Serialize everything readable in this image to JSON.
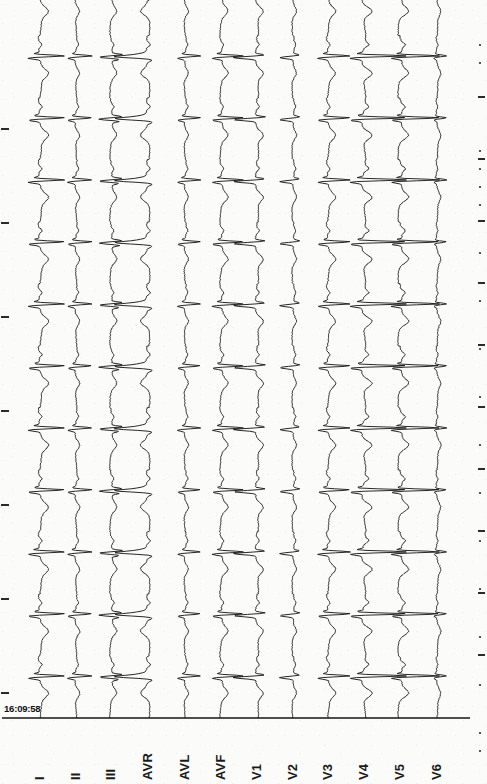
{
  "document": {
    "kind": "12-lead electrocardiogram strip",
    "orientation": "rotated-90-traces-run-vertically",
    "timestamp": "16:09:58",
    "background_color": "#fbfbf9",
    "trace_color": "#1c1c1c"
  },
  "leads": [
    {
      "label": "I",
      "x": 40,
      "amplitude": 26,
      "morphology": "qRs-tall-R"
    },
    {
      "label": "II",
      "x": 76,
      "amplitude": 17,
      "morphology": "rS-notched"
    },
    {
      "label": "III",
      "x": 111,
      "amplitude": 19,
      "morphology": "rSr-biphasic"
    },
    {
      "label": "AVR",
      "x": 148,
      "amplitude": 30,
      "morphology": "wide-negative"
    },
    {
      "label": "AVL",
      "x": 185,
      "amplitude": 16,
      "morphology": "small-rS"
    },
    {
      "label": "AVF",
      "x": 221,
      "amplitude": 22,
      "morphology": "rS-broad"
    },
    {
      "label": "V1",
      "x": 257,
      "amplitude": 24,
      "morphology": "rS-deep-S"
    },
    {
      "label": "V2",
      "x": 293,
      "amplitude": 15,
      "morphology": "notched-rS"
    },
    {
      "label": "V3",
      "x": 328,
      "amplitude": 23,
      "morphology": "RS-transition"
    },
    {
      "label": "V4",
      "x": 364,
      "amplitude": 36,
      "morphology": "tall-sharp-R"
    },
    {
      "label": "V5",
      "x": 400,
      "amplitude": 31,
      "morphology": "tall-sharp-R"
    },
    {
      "label": "V6",
      "x": 437,
      "amplitude": 12,
      "morphology": "small-narrow-R"
    }
  ],
  "rhythm": {
    "beat_count": 12,
    "first_beat_y": 36,
    "beat_interval_px": 62,
    "baseline_y": 718
  },
  "baseline_rule": {
    "x1": 2,
    "x2": 470,
    "y": 718
  },
  "left_ticks_y": [
    128,
    222,
    316,
    410,
    504,
    598,
    692
  ],
  "right_ticks_y": [
    96,
    158,
    220,
    282,
    344,
    406,
    468,
    530,
    592,
    654
  ],
  "micro_ticks_y": [
    44,
    62,
    150,
    168,
    186,
    204,
    252,
    300,
    348,
    396,
    444,
    492,
    540,
    588,
    636,
    684,
    732,
    750
  ]
}
